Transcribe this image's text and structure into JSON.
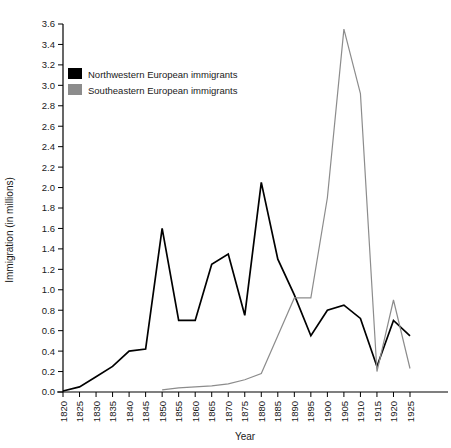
{
  "chart_data": {
    "type": "line",
    "title": "",
    "xlabel": "Year",
    "ylabel": "Immigration (in millions)",
    "xlim": [
      1820,
      1925
    ],
    "ylim": [
      0.0,
      3.6
    ],
    "grid": false,
    "legend_position": "top-left-inside",
    "x_tick_labels": [
      "1820",
      "1825",
      "1830",
      "1835",
      "1840",
      "1845",
      "1850",
      "1855",
      "1860",
      "1865",
      "1870",
      "1875",
      "1880",
      "1885",
      "1890",
      "1895",
      "1900",
      "1905",
      "1910",
      "1915",
      "1920",
      "1925"
    ],
    "y_tick_labels": [
      "0.0",
      "0.2",
      "0.4",
      "0.6",
      "0.8",
      "1.0",
      "1.2",
      "1.4",
      "1.6",
      "1.8",
      "2.0",
      "2.2",
      "2.4",
      "2.6",
      "2.8",
      "3.0",
      "3.2",
      "3.4",
      "3.6"
    ],
    "x": [
      1820,
      1825,
      1830,
      1835,
      1840,
      1845,
      1850,
      1855,
      1860,
      1865,
      1870,
      1875,
      1880,
      1885,
      1890,
      1895,
      1900,
      1905,
      1910,
      1915,
      1920,
      1925
    ],
    "series": [
      {
        "name": "Northwestern European immigrants",
        "color": "#000000",
        "x": [
          1820,
          1825,
          1830,
          1835,
          1840,
          1845,
          1850,
          1855,
          1860,
          1865,
          1870,
          1875,
          1880,
          1885,
          1890,
          1895,
          1900,
          1905,
          1910,
          1915,
          1920,
          1925
        ],
        "values": [
          0.01,
          0.05,
          0.15,
          0.25,
          0.4,
          0.42,
          1.6,
          0.7,
          0.7,
          1.25,
          1.35,
          0.75,
          2.05,
          1.3,
          0.95,
          0.55,
          0.8,
          0.85,
          0.72,
          0.25,
          0.7,
          0.55
        ]
      },
      {
        "name": "Southeastern European immigrants",
        "color": "#8c8c8c",
        "x": [
          1850,
          1855,
          1860,
          1865,
          1870,
          1875,
          1880,
          1885,
          1890,
          1895,
          1900,
          1905,
          1910,
          1915,
          1920,
          1925
        ],
        "values": [
          0.02,
          0.04,
          0.05,
          0.06,
          0.08,
          0.12,
          0.18,
          0.55,
          0.92,
          0.92,
          1.9,
          3.55,
          2.92,
          0.2,
          0.9,
          0.23
        ]
      }
    ]
  },
  "legend": {
    "items": [
      {
        "label": "Northwestern European immigrants",
        "color": "#000000"
      },
      {
        "label": "Southeastern European immigrants",
        "color": "#8c8c8c"
      }
    ]
  },
  "axes": {
    "x_title": "Year",
    "y_title": "Immigration (in millions)"
  }
}
